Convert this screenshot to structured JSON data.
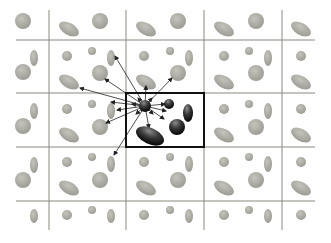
{
  "diagram": {
    "type": "grid-neighborhood-interaction",
    "colors": {
      "background": "#ffffff",
      "grid_line": "#8a8a80",
      "highlight_box": "#111111",
      "particle_gray": "#a8a8a0",
      "particle_dark": "#1a1a1a",
      "arrow": "#222222"
    },
    "grid": {
      "vertical_lines_x": [
        49,
        126,
        204,
        282
      ],
      "horizontal_lines_y": [
        40,
        93,
        147,
        201
      ],
      "extent": {
        "x0": 16,
        "x1": 315,
        "y0": 10,
        "y1": 230
      }
    },
    "highlight_box": {
      "x": 126,
      "y": 93,
      "w": 78,
      "h": 54
    },
    "source_particle": {
      "cx": 145,
      "cy": 106,
      "r": 6
    },
    "dark_particles": [
      {
        "shape": "circle",
        "cx": 169,
        "cy": 104,
        "rx": 5,
        "ry": 5,
        "rot": 0
      },
      {
        "shape": "ellipse",
        "cx": 188,
        "cy": 113,
        "rx": 5,
        "ry": 9,
        "rot": 0
      },
      {
        "shape": "circle",
        "cx": 177,
        "cy": 127,
        "rx": 8,
        "ry": 8,
        "rot": 0
      },
      {
        "shape": "ellipse",
        "cx": 150,
        "cy": 136,
        "rx": 15,
        "ry": 8,
        "rot": 25
      }
    ],
    "gray_particles": [
      {
        "cx": 23,
        "cy": 21,
        "rx": 8,
        "ry": 8,
        "rot": 0
      },
      {
        "cx": 69,
        "cy": 29,
        "rx": 11,
        "ry": 6,
        "rot": 30
      },
      {
        "cx": 100,
        "cy": 21,
        "rx": 8,
        "ry": 8,
        "rot": 0
      },
      {
        "cx": 146,
        "cy": 29,
        "rx": 11,
        "ry": 6,
        "rot": 30
      },
      {
        "cx": 178,
        "cy": 21,
        "rx": 8,
        "ry": 8,
        "rot": 0
      },
      {
        "cx": 224,
        "cy": 29,
        "rx": 11,
        "ry": 6,
        "rot": 30
      },
      {
        "cx": 256,
        "cy": 21,
        "rx": 8,
        "ry": 8,
        "rot": 0
      },
      {
        "cx": 301,
        "cy": 29,
        "rx": 11,
        "ry": 6,
        "rot": 30
      },
      {
        "cx": 34,
        "cy": 58,
        "rx": 4,
        "ry": 8,
        "rot": 0
      },
      {
        "cx": 23,
        "cy": 72,
        "rx": 8,
        "ry": 8,
        "rot": 0
      },
      {
        "cx": 67,
        "cy": 56,
        "rx": 5,
        "ry": 5,
        "rot": 0
      },
      {
        "cx": 92,
        "cy": 51,
        "rx": 4,
        "ry": 4,
        "rot": 0
      },
      {
        "cx": 111,
        "cy": 58,
        "rx": 4,
        "ry": 8,
        "rot": 0
      },
      {
        "cx": 100,
        "cy": 73,
        "rx": 8,
        "ry": 8,
        "rot": 0
      },
      {
        "cx": 69,
        "cy": 82,
        "rx": 11,
        "ry": 6,
        "rot": 30
      },
      {
        "cx": 144,
        "cy": 56,
        "rx": 5,
        "ry": 5,
        "rot": 0
      },
      {
        "cx": 146,
        "cy": 82,
        "rx": 11,
        "ry": 6,
        "rot": 30
      },
      {
        "cx": 170,
        "cy": 51,
        "rx": 4,
        "ry": 4,
        "rot": 0
      },
      {
        "cx": 189,
        "cy": 58,
        "rx": 4,
        "ry": 8,
        "rot": 0
      },
      {
        "cx": 178,
        "cy": 73,
        "rx": 8,
        "ry": 8,
        "rot": 0
      },
      {
        "cx": 224,
        "cy": 56,
        "rx": 5,
        "ry": 5,
        "rot": 0
      },
      {
        "cx": 249,
        "cy": 51,
        "rx": 4,
        "ry": 4,
        "rot": 0
      },
      {
        "cx": 268,
        "cy": 58,
        "rx": 4,
        "ry": 8,
        "rot": 0
      },
      {
        "cx": 256,
        "cy": 73,
        "rx": 8,
        "ry": 8,
        "rot": 0
      },
      {
        "cx": 224,
        "cy": 82,
        "rx": 11,
        "ry": 6,
        "rot": 30
      },
      {
        "cx": 301,
        "cy": 56,
        "rx": 5,
        "ry": 5,
        "rot": 0
      },
      {
        "cx": 301,
        "cy": 82,
        "rx": 11,
        "ry": 6,
        "rot": 30
      },
      {
        "cx": 34,
        "cy": 111,
        "rx": 4,
        "ry": 8,
        "rot": 0
      },
      {
        "cx": 23,
        "cy": 126,
        "rx": 8,
        "ry": 8,
        "rot": 0
      },
      {
        "cx": 67,
        "cy": 109,
        "rx": 5,
        "ry": 5,
        "rot": 0
      },
      {
        "cx": 92,
        "cy": 104,
        "rx": 4,
        "ry": 4,
        "rot": 0
      },
      {
        "cx": 111,
        "cy": 111,
        "rx": 4,
        "ry": 8,
        "rot": 0
      },
      {
        "cx": 100,
        "cy": 127,
        "rx": 8,
        "ry": 8,
        "rot": 0
      },
      {
        "cx": 69,
        "cy": 135,
        "rx": 11,
        "ry": 6,
        "rot": 30
      },
      {
        "cx": 224,
        "cy": 109,
        "rx": 5,
        "ry": 5,
        "rot": 0
      },
      {
        "cx": 249,
        "cy": 104,
        "rx": 4,
        "ry": 4,
        "rot": 0
      },
      {
        "cx": 268,
        "cy": 111,
        "rx": 4,
        "ry": 8,
        "rot": 0
      },
      {
        "cx": 256,
        "cy": 127,
        "rx": 8,
        "ry": 8,
        "rot": 0
      },
      {
        "cx": 224,
        "cy": 135,
        "rx": 11,
        "ry": 6,
        "rot": 30
      },
      {
        "cx": 301,
        "cy": 109,
        "rx": 5,
        "ry": 5,
        "rot": 0
      },
      {
        "cx": 301,
        "cy": 135,
        "rx": 11,
        "ry": 6,
        "rot": 30
      },
      {
        "cx": 34,
        "cy": 165,
        "rx": 4,
        "ry": 8,
        "rot": 0
      },
      {
        "cx": 23,
        "cy": 180,
        "rx": 8,
        "ry": 8,
        "rot": 0
      },
      {
        "cx": 67,
        "cy": 162,
        "rx": 5,
        "ry": 5,
        "rot": 0
      },
      {
        "cx": 92,
        "cy": 157,
        "rx": 4,
        "ry": 4,
        "rot": 0
      },
      {
        "cx": 111,
        "cy": 164,
        "rx": 4,
        "ry": 8,
        "rot": 0
      },
      {
        "cx": 100,
        "cy": 180,
        "rx": 8,
        "ry": 8,
        "rot": 0
      },
      {
        "cx": 69,
        "cy": 188,
        "rx": 11,
        "ry": 6,
        "rot": 30
      },
      {
        "cx": 144,
        "cy": 162,
        "rx": 5,
        "ry": 5,
        "rot": 0
      },
      {
        "cx": 170,
        "cy": 157,
        "rx": 4,
        "ry": 4,
        "rot": 0
      },
      {
        "cx": 189,
        "cy": 164,
        "rx": 4,
        "ry": 8,
        "rot": 0
      },
      {
        "cx": 178,
        "cy": 180,
        "rx": 8,
        "ry": 8,
        "rot": 0
      },
      {
        "cx": 146,
        "cy": 188,
        "rx": 11,
        "ry": 6,
        "rot": 30
      },
      {
        "cx": 224,
        "cy": 162,
        "rx": 5,
        "ry": 5,
        "rot": 0
      },
      {
        "cx": 249,
        "cy": 157,
        "rx": 4,
        "ry": 4,
        "rot": 0
      },
      {
        "cx": 268,
        "cy": 164,
        "rx": 4,
        "ry": 8,
        "rot": 0
      },
      {
        "cx": 256,
        "cy": 180,
        "rx": 8,
        "ry": 8,
        "rot": 0
      },
      {
        "cx": 224,
        "cy": 188,
        "rx": 11,
        "ry": 6,
        "rot": 30
      },
      {
        "cx": 301,
        "cy": 162,
        "rx": 5,
        "ry": 5,
        "rot": 0
      },
      {
        "cx": 301,
        "cy": 188,
        "rx": 11,
        "ry": 6,
        "rot": 30
      },
      {
        "cx": 34,
        "cy": 216,
        "rx": 4,
        "ry": 7,
        "rot": 0
      },
      {
        "cx": 67,
        "cy": 215,
        "rx": 5,
        "ry": 5,
        "rot": 0
      },
      {
        "cx": 92,
        "cy": 210,
        "rx": 4,
        "ry": 4,
        "rot": 0
      },
      {
        "cx": 111,
        "cy": 216,
        "rx": 4,
        "ry": 7,
        "rot": 0
      },
      {
        "cx": 144,
        "cy": 215,
        "rx": 5,
        "ry": 5,
        "rot": 0
      },
      {
        "cx": 170,
        "cy": 210,
        "rx": 4,
        "ry": 4,
        "rot": 0
      },
      {
        "cx": 189,
        "cy": 216,
        "rx": 4,
        "ry": 7,
        "rot": 0
      },
      {
        "cx": 224,
        "cy": 215,
        "rx": 5,
        "ry": 5,
        "rot": 0
      },
      {
        "cx": 249,
        "cy": 210,
        "rx": 4,
        "ry": 4,
        "rot": 0
      },
      {
        "cx": 268,
        "cy": 216,
        "rx": 4,
        "ry": 7,
        "rot": 0
      },
      {
        "cx": 301,
        "cy": 215,
        "rx": 5,
        "ry": 5,
        "rot": 0
      }
    ],
    "arrows": [
      {
        "x2": 115,
        "y2": 56
      },
      {
        "x2": 105,
        "y2": 79
      },
      {
        "x2": 80,
        "y2": 88
      },
      {
        "x2": 146,
        "y2": 86
      },
      {
        "x2": 172,
        "y2": 78
      },
      {
        "x2": 111,
        "y2": 102
      },
      {
        "x2": 117,
        "y2": 110
      },
      {
        "x2": 106,
        "y2": 123
      },
      {
        "x2": 114,
        "y2": 155
      },
      {
        "x2": 165,
        "y2": 104
      },
      {
        "x2": 166,
        "y2": 111
      },
      {
        "x2": 164,
        "y2": 119
      },
      {
        "x2": 149,
        "y2": 128
      },
      {
        "x2": 132,
        "y2": 104
      },
      {
        "x2": 138,
        "y2": 98
      },
      {
        "x2": 152,
        "y2": 98
      },
      {
        "x2": 136,
        "y2": 114
      },
      {
        "x2": 153,
        "y2": 114
      }
    ]
  }
}
